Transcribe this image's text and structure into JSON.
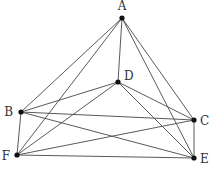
{
  "diagram": {
    "type": "geometry-figure",
    "points": [
      {
        "id": "A",
        "label": "A",
        "x": 122,
        "y": 18,
        "lx": 122,
        "ly": 10,
        "anchor": "middle"
      },
      {
        "id": "D",
        "label": "D",
        "x": 118,
        "y": 82,
        "lx": 124,
        "ly": 80,
        "anchor": "start"
      },
      {
        "id": "B",
        "label": "B",
        "x": 21,
        "y": 112,
        "lx": 13,
        "ly": 116,
        "anchor": "end"
      },
      {
        "id": "C",
        "label": "C",
        "x": 194,
        "y": 120,
        "lx": 200,
        "ly": 125,
        "anchor": "start"
      },
      {
        "id": "F",
        "label": "F",
        "x": 17,
        "y": 155,
        "lx": 10,
        "ly": 160,
        "anchor": "end"
      },
      {
        "id": "E",
        "label": "E",
        "x": 194,
        "y": 158,
        "lx": 200,
        "ly": 163,
        "anchor": "start"
      }
    ],
    "edges": [
      [
        "A",
        "B"
      ],
      [
        "A",
        "F"
      ],
      [
        "A",
        "D"
      ],
      [
        "A",
        "C"
      ],
      [
        "A",
        "E"
      ],
      [
        "D",
        "B"
      ],
      [
        "D",
        "F"
      ],
      [
        "D",
        "C"
      ],
      [
        "D",
        "E"
      ],
      [
        "B",
        "C"
      ],
      [
        "B",
        "E"
      ],
      [
        "B",
        "F"
      ],
      [
        "F",
        "C"
      ],
      [
        "F",
        "E"
      ],
      [
        "C",
        "E"
      ]
    ],
    "colors": {
      "edge": "#5a5a5a",
      "point": "#111111",
      "label": "#333333"
    }
  }
}
